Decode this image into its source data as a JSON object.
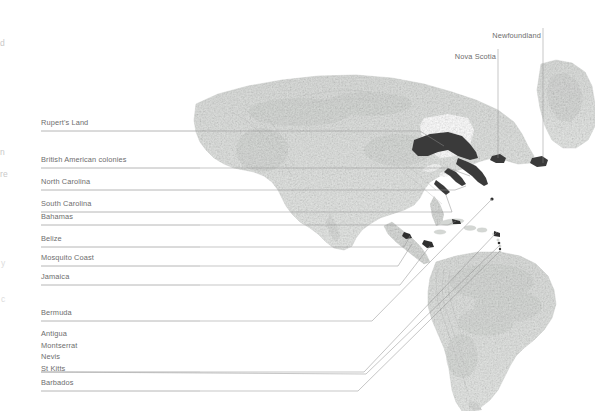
{
  "figure": {
    "kind": "shaded-relief-map",
    "region": "The Americas and North Atlantic",
    "background_color": "#ffffff",
    "land_color": "#d6d8d6",
    "highlight_color": "#3a3a3a",
    "leader_line_color": "#8d8d8d",
    "text_color": "#6d6d6d"
  },
  "left_labels": [
    {
      "id": "ruperts-land",
      "text": "Rupert's Land",
      "y": 118,
      "rule_y": 131,
      "rule_x2": 420
    },
    {
      "id": "british-colonies",
      "text": "British American colonies",
      "y": 155,
      "rule_y": 168,
      "rule_x2": 448
    },
    {
      "id": "north-carolina",
      "text": "North Carolina",
      "y": 177,
      "rule_y": 190,
      "rule_x2": 455
    },
    {
      "id": "south-carolina",
      "text": "South Carolina",
      "y": 199,
      "rule_y": 212,
      "rule_x2": 460
    },
    {
      "id": "bahamas",
      "text": "Bahamas",
      "y": 212,
      "rule_y": 225,
      "rule_x2": 448
    },
    {
      "id": "belize",
      "text": "Belize",
      "y": 234,
      "rule_y": 247,
      "rule_x2": 404
    },
    {
      "id": "mosquito-coast",
      "text": "Mosquito Coast",
      "y": 253,
      "rule_y": 266,
      "rule_x2": 398
    },
    {
      "id": "jamaica",
      "text": "Jamaica",
      "y": 272,
      "rule_y": 285,
      "rule_x2": 400
    },
    {
      "id": "bermuda",
      "text": "Bermuda",
      "y": 308,
      "rule_y": 321,
      "rule_x2": 372
    },
    {
      "id": "barbados",
      "text": "Barbados",
      "y": 378,
      "rule_y": 391,
      "rule_x2": 358
    }
  ],
  "left_label_group": {
    "id": "leeward-islands",
    "items": [
      "Antigua",
      "Montserrat",
      "Nevis",
      "St Kitts"
    ],
    "y_start": 329,
    "line_height": 11.5,
    "rule_y": 372,
    "rule_x2": 364
  },
  "top_labels": [
    {
      "id": "newfoundland",
      "text": "Newfoundland",
      "x_right": 541,
      "y": 31,
      "line_x": 543,
      "line_y1": 28,
      "line_y2": 163
    },
    {
      "id": "nova-scotia",
      "text": "Nova Scotia",
      "x_right": 496,
      "y": 52,
      "line_x": 498,
      "line_y1": 49,
      "line_y2": 158
    }
  ],
  "edge_fragments": [
    {
      "text": "d",
      "x": 0,
      "y": 38
    },
    {
      "text": "n",
      "x": 0,
      "y": 147
    },
    {
      "text": "re",
      "x": 0,
      "y": 169
    },
    {
      "text": "y",
      "x": 1,
      "y": 258
    },
    {
      "text": "c",
      "x": 1,
      "y": 294
    }
  ]
}
